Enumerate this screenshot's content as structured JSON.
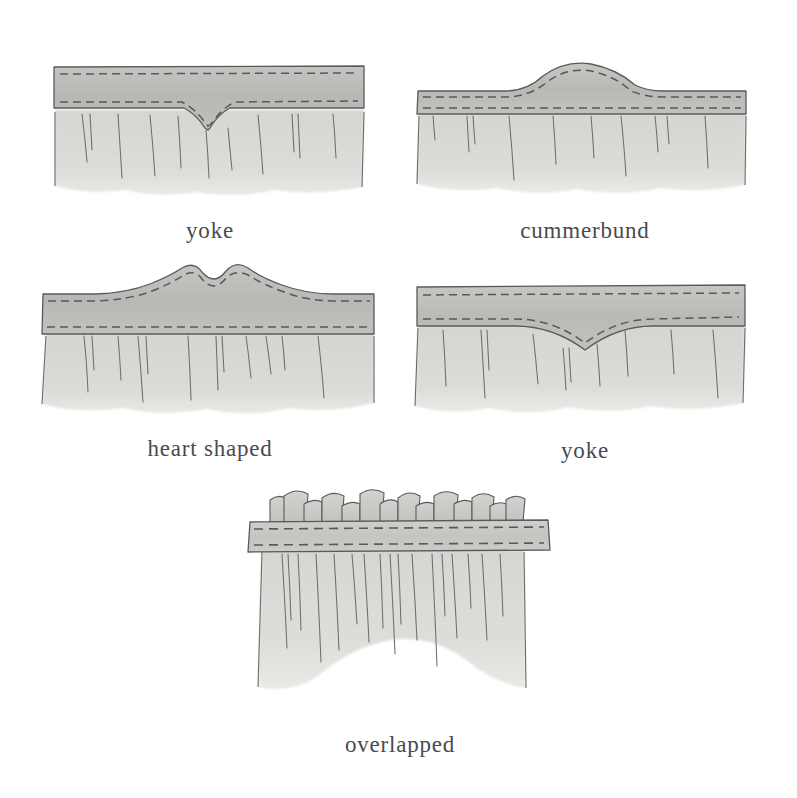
{
  "plate": {
    "background_color": "#ffffff",
    "width": 797,
    "height": 798,
    "style": "pencil-and-wash technical illustration",
    "subject": "curtain valance heading styles"
  },
  "palette": {
    "background": "#ffffff",
    "band_fill": "#b9b9b5",
    "band_fill_light": "#c6c6c2",
    "skirt_fill": "#d9d9d5",
    "skirt_fill_shade": "#cbcbc7",
    "outline": "#5a5a5e",
    "stitch": "#58585c",
    "pleat_line": "#6d6d72",
    "caption_text": "#4a4a4f"
  },
  "figures": [
    {
      "id": "yoke-v",
      "label": "yoke",
      "heading_shape": "straight band with V-shaped lower edge",
      "band": {
        "top_edge": "straight",
        "bottom_edge": "v-notch"
      },
      "stitch_rows": 2,
      "pleat_count": 9,
      "hem": "soft feathered"
    },
    {
      "id": "cummerbund",
      "label": "cummerbund",
      "heading_shape": "band with raised centre arch on upper edge",
      "band": {
        "top_edge": "centre-arch",
        "bottom_edge": "straight"
      },
      "stitch_rows": 2,
      "pleat_count": 9,
      "hem": "soft feathered"
    },
    {
      "id": "heart-shaped",
      "label": "heart shaped",
      "heading_shape": "band with twin-lobed heart crest on upper edge",
      "band": {
        "top_edge": "double-lobe-heart",
        "bottom_edge": "straight"
      },
      "stitch_rows": 2,
      "pleat_count": 10,
      "hem": "soft feathered"
    },
    {
      "id": "yoke-curve",
      "label": "yoke",
      "heading_shape": "straight band with deep curved scoop on lower edge",
      "band": {
        "top_edge": "straight",
        "bottom_edge": "curved-scoop"
      },
      "stitch_rows": 2,
      "pleat_count": 9,
      "hem": "soft feathered"
    },
    {
      "id": "overlapped",
      "label": "overlapped",
      "heading_shape": "flat band with overlapping pleat tabs standing above it",
      "band": {
        "top_edge": "straight-with-tabs",
        "bottom_edge": "straight"
      },
      "stitch_rows": 2,
      "tab_count": 11,
      "pleat_count": 16,
      "hem": "scalloped curved"
    }
  ],
  "captions": {
    "yoke_v": "yoke",
    "cummerbund": "cummerbund",
    "heart_shaped": "heart shaped",
    "yoke_curve": "yoke",
    "overlapped": "overlapped"
  }
}
